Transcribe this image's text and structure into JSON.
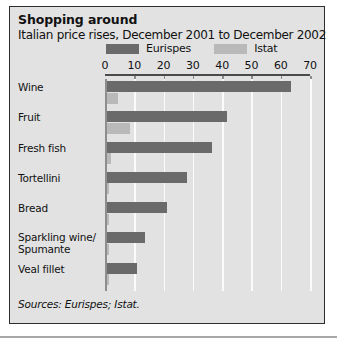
{
  "chart_data": {
    "type": "bar",
    "orientation": "horizontal",
    "title": "Shopping around",
    "subtitle": "Italian price rises, December 2001 to December 2002",
    "xlabel": "",
    "ylabel": "",
    "xlim": [
      0,
      70
    ],
    "ticks": [
      0,
      10,
      20,
      30,
      40,
      50,
      60,
      70
    ],
    "grid": true,
    "legend_position": "top",
    "categories": [
      "Wine",
      "Fruit",
      "Fresh fish",
      "Tortellini",
      "Bread",
      "Sparkling wine/\nSpumante",
      "Veal fillet"
    ],
    "series": [
      {
        "name": "Eurispes",
        "color": "#6a6a6a",
        "values": [
          63.5,
          41.5,
          36.5,
          28.0,
          21.0,
          13.5,
          11.0
        ]
      },
      {
        "name": "Istat",
        "color": "#b9b9b9",
        "values": [
          4.5,
          8.5,
          2.0,
          1.5,
          1.5,
          1.5,
          1.5
        ]
      }
    ],
    "source": "Sources: Eurispes; Istat."
  },
  "header": {
    "title": "Shopping around",
    "subtitle": "Italian price rises, December 2001 to December 2002"
  },
  "legend": {
    "items": [
      {
        "label": "Eurispes",
        "color": "#6a6a6a"
      },
      {
        "label": "Istat",
        "color": "#b9b9b9"
      }
    ]
  },
  "axis": {
    "tick_labels": [
      "0",
      "10",
      "20",
      "30",
      "40",
      "50",
      "60",
      "70"
    ]
  },
  "categories": [
    {
      "line1": "Wine",
      "line2": ""
    },
    {
      "line1": "Fruit",
      "line2": ""
    },
    {
      "line1": "Fresh fish",
      "line2": ""
    },
    {
      "line1": "Tortellini",
      "line2": ""
    },
    {
      "line1": "Bread",
      "line2": ""
    },
    {
      "line1": "Sparkling wine/",
      "line2": "Spumante"
    },
    {
      "line1": "Veal fillet",
      "line2": ""
    }
  ],
  "footer": {
    "source": "Sources: Eurispes; Istat."
  }
}
